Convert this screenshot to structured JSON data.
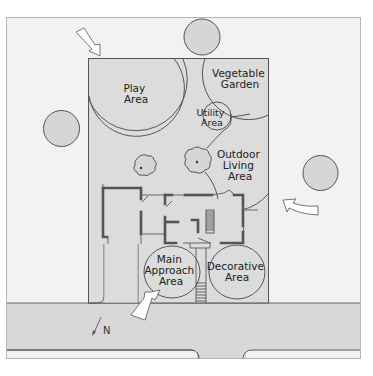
{
  "diagram": {
    "type": "landscape-zoning-site-plan",
    "colors": {
      "page_background": "#ffffff",
      "frame_background": "#f2f2f2",
      "lot_fill": "#dcdcdc",
      "street_fill": "#d8d8d8",
      "tree_fill": "#d6d6d6",
      "line": "#555555",
      "arrow_fill": "#ffffff"
    },
    "zones": [
      {
        "id": "play",
        "lines": [
          "Play",
          "Area"
        ]
      },
      {
        "id": "vegetable",
        "lines": [
          "Vegetable",
          "Garden"
        ]
      },
      {
        "id": "utility",
        "lines": [
          "Utility",
          "Area"
        ]
      },
      {
        "id": "outdoor",
        "lines": [
          "Outdoor",
          "Living",
          "Area"
        ]
      },
      {
        "id": "approach",
        "lines": [
          "Main",
          "Approach",
          "Area"
        ]
      },
      {
        "id": "decorative",
        "lines": [
          "Decorative",
          "Area"
        ]
      }
    ],
    "north_label": "N",
    "elements": {
      "off_site_trees": 3,
      "on_site_shrubs": 2,
      "view_arrows": 3,
      "house": "floor plan with garage, porch and front steps",
      "street": "road along bottom with driveway opening"
    }
  }
}
